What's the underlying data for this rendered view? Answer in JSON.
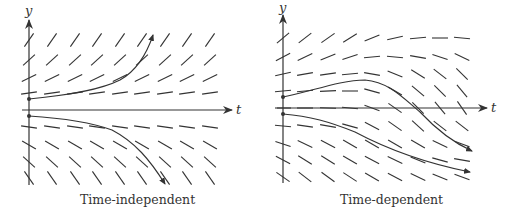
{
  "colors": {
    "ink": "#333333",
    "background": "#ffffff"
  },
  "panels": [
    {
      "id": "left",
      "caption": "Time-independent",
      "axes": {
        "x_label": "t",
        "y_label": "y"
      },
      "origin": [
        29,
        110
      ],
      "x_axis": [
        22,
        232
      ],
      "y_axis": [
        185,
        20
      ],
      "columns": [
        29,
        52,
        75,
        97,
        120,
        142,
        165,
        187,
        210
      ],
      "rows": [
        {
          "y": 40,
          "angles": [
            55,
            55,
            55,
            55,
            55,
            55,
            55,
            55,
            55
          ]
        },
        {
          "y": 60,
          "angles": [
            42,
            42,
            42,
            42,
            42,
            42,
            42,
            42,
            42
          ]
        },
        {
          "y": 78,
          "angles": [
            26,
            26,
            26,
            26,
            26,
            26,
            26,
            26,
            26
          ]
        },
        {
          "y": 93,
          "angles": [
            8,
            8,
            8,
            8,
            8,
            8,
            8,
            8,
            8
          ]
        },
        {
          "y": 127,
          "angles": [
            -8,
            -8,
            -8,
            -8,
            -8,
            -8,
            -8,
            -8,
            -8
          ]
        },
        {
          "y": 145,
          "angles": [
            -30,
            -30,
            -30,
            -30,
            -30,
            -30,
            -30,
            -30,
            -30
          ]
        },
        {
          "y": 162,
          "angles": [
            -42,
            -42,
            -42,
            -42,
            -42,
            -42,
            -42,
            -42,
            -42
          ]
        },
        {
          "y": 178,
          "angles": [
            -55,
            -55,
            -55,
            -55,
            -55,
            -55,
            -55,
            -55,
            -55
          ]
        }
      ],
      "curves": [
        {
          "name": "upper-solution",
          "path": "M29,99 C70,95 100,90 120,80 C138,70 148,50 153,35"
        },
        {
          "name": "lower-solution",
          "path": "M29,116 C60,118 90,122 112,130 C135,142 150,160 165,184"
        }
      ]
    },
    {
      "id": "right",
      "caption": "Time-dependent",
      "axes": {
        "x_label": "t",
        "y_label": "y"
      },
      "origin": [
        283,
        108
      ],
      "x_axis": [
        277,
        487
      ],
      "y_axis": [
        183,
        15
      ],
      "columns": [
        283,
        305,
        328,
        350,
        372,
        395,
        418,
        440,
        462
      ],
      "rows": [
        {
          "y": 38,
          "angles": [
            40,
            38,
            35,
            32,
            22,
            12,
            5,
            0,
            -5
          ]
        },
        {
          "y": 57,
          "angles": [
            28,
            25,
            22,
            18,
            5,
            -5,
            -10,
            -18,
            -25
          ]
        },
        {
          "y": 74,
          "angles": [
            12,
            10,
            8,
            5,
            -10,
            -22,
            -32,
            -38,
            -45
          ]
        },
        {
          "y": 91,
          "angles": [
            5,
            5,
            3,
            0,
            -15,
            -30,
            -40,
            -45,
            -50
          ]
        },
        {
          "y": 108,
          "angles": [
            0,
            0,
            -2,
            -5,
            -20,
            -35,
            -45,
            -50,
            -55
          ]
        },
        {
          "y": 126,
          "angles": [
            -5,
            -8,
            -10,
            -15,
            -28,
            -35,
            -42,
            -38,
            -38
          ]
        },
        {
          "y": 144,
          "angles": [
            -18,
            -25,
            -28,
            -30,
            -30,
            -30,
            -30,
            -25,
            -20
          ]
        },
        {
          "y": 160,
          "angles": [
            -28,
            -32,
            -32,
            -30,
            -28,
            -25,
            -22,
            -15,
            -10
          ]
        },
        {
          "y": 177,
          "angles": [
            -35,
            -38,
            -36,
            -33,
            -30,
            -28,
            -25,
            -22,
            -20
          ]
        }
      ],
      "curves": [
        {
          "name": "upper-solution",
          "path": "M283,97 C310,92 340,80 365,80 C390,82 405,100 420,112 C435,128 452,142 472,151"
        },
        {
          "name": "lower-solution",
          "path": "M283,114 C310,116 330,122 355,132 C385,148 420,162 470,172"
        }
      ]
    }
  ],
  "captions": {
    "left": "Time-independent",
    "right": "Time-dependent"
  },
  "labels": {
    "left_y": "y",
    "left_t": "t",
    "right_y": "y",
    "right_t": "t"
  }
}
